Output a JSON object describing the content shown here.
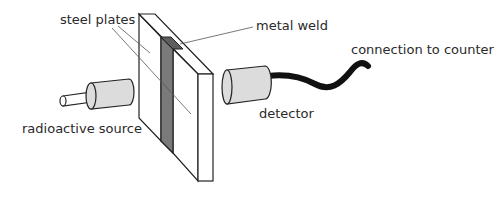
{
  "diagram": {
    "labels": {
      "steel_plates": "steel plates",
      "metal_weld": "metal weld",
      "connection": "connection to counter",
      "source": "radioactive source",
      "detector": "detector"
    },
    "colors": {
      "outline": "#222222",
      "cylinder_fill": "#dcdcdc",
      "weld_fill": "#7a7a7a",
      "weld_top_fill": "#5e5e5e",
      "plate_fill": "#ffffff",
      "cable": "#111111",
      "leader": "#555555"
    }
  }
}
